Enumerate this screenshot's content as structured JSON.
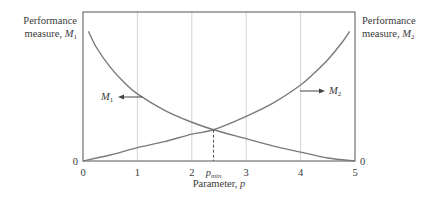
{
  "chart_data": {
    "type": "line",
    "title": "",
    "xlabel": "Parameter, p",
    "xlabel_text": "Parameter, ",
    "xlabel_var": "p",
    "xlim": [
      0,
      5
    ],
    "ylim": [
      0,
      1
    ],
    "x_ticks": [
      0,
      1,
      2,
      3,
      4,
      5
    ],
    "x_tick_labels": [
      "0",
      "1",
      "2",
      "3",
      "4",
      "5"
    ],
    "grid": "vertical",
    "left_axis": {
      "label_line1": "Performance",
      "label_line2": "measure, ",
      "label_var": "M",
      "label_sub": "1",
      "zero_label": "0"
    },
    "right_axis": {
      "label_line1": "Performance",
      "label_line2": "measure, ",
      "label_var": "M",
      "label_sub": "2",
      "zero_label": "0"
    },
    "series": [
      {
        "name": "M1",
        "label_var": "M",
        "label_sub": "1",
        "trend": "decreasing",
        "x": [
          0.1,
          0.25,
          0.5,
          0.75,
          1.0,
          1.5,
          2.0,
          2.4,
          3.0,
          3.5,
          4.0,
          4.5,
          5.0
        ],
        "y": [
          0.87,
          0.76,
          0.63,
          0.53,
          0.45,
          0.34,
          0.26,
          0.21,
          0.15,
          0.1,
          0.06,
          0.02,
          0.0
        ]
      },
      {
        "name": "M2",
        "label_var": "M",
        "label_sub": "2",
        "trend": "increasing",
        "x": [
          0.0,
          0.5,
          1.0,
          1.5,
          2.0,
          2.4,
          3.0,
          3.5,
          4.0,
          4.25,
          4.5,
          4.75,
          4.9
        ],
        "y": [
          0.0,
          0.04,
          0.09,
          0.13,
          0.18,
          0.21,
          0.3,
          0.39,
          0.51,
          0.59,
          0.68,
          0.79,
          0.87
        ]
      }
    ],
    "annotations": [
      {
        "text": "p_min",
        "var": "p",
        "sub": "min",
        "x": 2.4,
        "style": "dashed vertical line from crossing to axis"
      }
    ]
  }
}
